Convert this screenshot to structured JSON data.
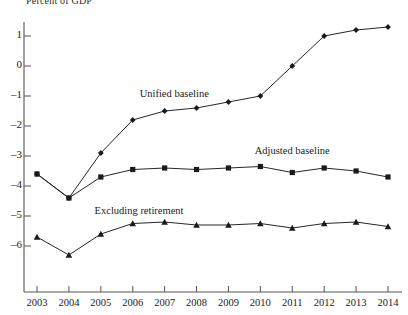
{
  "chart_data": {
    "type": "line",
    "title": "Percent of GDP",
    "xlabel": "",
    "ylabel": "Percent of GDP",
    "grid": false,
    "legend_position": "inline-annotations",
    "categories": [
      2003,
      2004,
      2005,
      2006,
      2007,
      2008,
      2009,
      2010,
      2011,
      2012,
      2013,
      2014
    ],
    "xlim": [
      2003,
      2014
    ],
    "ylim": [
      -6.6,
      1.6
    ],
    "yticks": [
      1,
      0,
      -1,
      -2,
      -3,
      -4,
      -5,
      -6
    ],
    "ytick_labels": [
      "1",
      "0",
      "–1",
      "–2",
      "–3",
      "–4",
      "–5",
      "–6"
    ],
    "xtick_labels": [
      "2003",
      "2004",
      "2005",
      "2006",
      "2007",
      "2008",
      "2009",
      "2010",
      "2011",
      "2012",
      "2013",
      "2014"
    ],
    "series": [
      {
        "name": "Unified baseline",
        "marker": "diamond",
        "color": "#1a1a1a",
        "label_x": 2007.3,
        "label_y": -0.95,
        "values": [
          -3.6,
          -4.4,
          -2.9,
          -1.8,
          -1.5,
          -1.4,
          -1.2,
          -1.0,
          0.0,
          1.0,
          1.2,
          1.3
        ]
      },
      {
        "name": "Adjusted baseline",
        "marker": "square",
        "color": "#1a1a1a",
        "label_x": 2011.0,
        "label_y": -2.85,
        "values": [
          -3.6,
          -4.4,
          -3.7,
          -3.45,
          -3.4,
          -3.45,
          -3.4,
          -3.35,
          -3.55,
          -3.4,
          -3.5,
          -3.7
        ]
      },
      {
        "name": "Excluding retirement",
        "marker": "triangle",
        "color": "#1a1a1a",
        "label_x": 2006.2,
        "label_y": -4.85,
        "values": [
          -5.7,
          -6.3,
          -5.6,
          -5.25,
          -5.2,
          -5.3,
          -5.3,
          -5.25,
          -5.4,
          -5.25,
          -5.2,
          -5.35
        ]
      }
    ]
  },
  "axis": {
    "title": "Percent of GDP"
  }
}
